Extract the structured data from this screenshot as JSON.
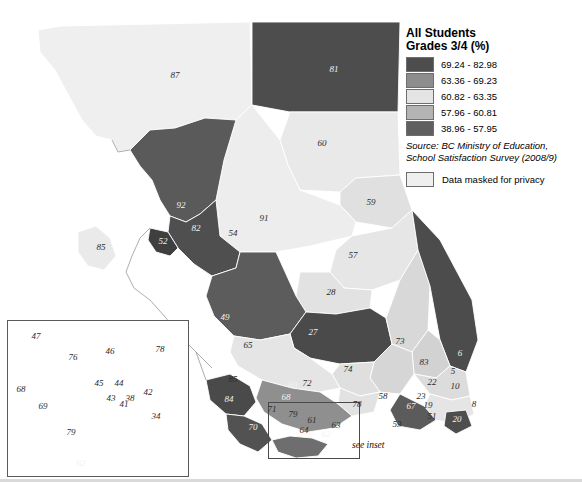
{
  "title": "Students learning about an",
  "legend": {
    "heading_line1": "All Students",
    "heading_line2": "Grades 3/4 (%)",
    "classes": [
      {
        "label": "69.24 - 82.98",
        "color": "#4d4d4d"
      },
      {
        "label": "63.36 - 69.23",
        "color": "#8d8d8d"
      },
      {
        "label": "60.82 - 63.35",
        "color": "#e4e4e4"
      },
      {
        "label": "57.96 - 60.81",
        "color": "#b4b4b4"
      },
      {
        "label": "38.96 - 57.95",
        "color": "#5f5f5f"
      }
    ],
    "source": "Source: BC Ministry of Education, School Satisfaction Survey (2008/9)",
    "masked_label": "Data masked for privacy",
    "masked_color": "#efefef"
  },
  "inset_caption": "see inset",
  "districts": [
    {
      "id": "87",
      "x": 175,
      "y": 75,
      "tone": "light"
    },
    {
      "id": "81",
      "x": 334,
      "y": 69,
      "tone": "dark"
    },
    {
      "id": "60",
      "x": 322,
      "y": 143,
      "tone": "light"
    },
    {
      "id": "59",
      "x": 371,
      "y": 202,
      "tone": "light"
    },
    {
      "id": "92",
      "x": 181,
      "y": 205,
      "tone": "dark"
    },
    {
      "id": "82",
      "x": 196,
      "y": 228,
      "tone": "dark"
    },
    {
      "id": "52",
      "x": 163,
      "y": 241,
      "tone": "dark"
    },
    {
      "id": "85",
      "x": 101,
      "y": 247,
      "tone": "light"
    },
    {
      "id": "91",
      "x": 264,
      "y": 218,
      "tone": "light"
    },
    {
      "id": "54",
      "x": 233,
      "y": 233,
      "tone": "light"
    },
    {
      "id": "57",
      "x": 353,
      "y": 255,
      "tone": "light"
    },
    {
      "id": "28",
      "x": 331,
      "y": 292,
      "tone": "light"
    },
    {
      "id": "49",
      "x": 225,
      "y": 317,
      "tone": "dark"
    },
    {
      "id": "27",
      "x": 313,
      "y": 332,
      "tone": "dark"
    },
    {
      "id": "73",
      "x": 400,
      "y": 341,
      "tone": "light"
    },
    {
      "id": "6",
      "x": 460,
      "y": 353,
      "tone": "dark"
    },
    {
      "id": "83",
      "x": 424,
      "y": 362,
      "tone": "light"
    },
    {
      "id": "5",
      "x": 453,
      "y": 371,
      "tone": "light"
    },
    {
      "id": "22",
      "x": 432,
      "y": 382,
      "tone": "light"
    },
    {
      "id": "10",
      "x": 455,
      "y": 386,
      "tone": "light"
    },
    {
      "id": "23",
      "x": 421,
      "y": 396,
      "tone": "light"
    },
    {
      "id": "67",
      "x": 411,
      "y": 406,
      "tone": "dark"
    },
    {
      "id": "19",
      "x": 428,
      "y": 405,
      "tone": "light"
    },
    {
      "id": "51",
      "x": 432,
      "y": 416,
      "tone": "light"
    },
    {
      "id": "20",
      "x": 457,
      "y": 419,
      "tone": "dark"
    },
    {
      "id": "8",
      "x": 474,
      "y": 404,
      "tone": "light"
    },
    {
      "id": "53",
      "x": 397,
      "y": 424,
      "tone": "light"
    },
    {
      "id": "58",
      "x": 383,
      "y": 396,
      "tone": "light"
    },
    {
      "id": "78",
      "x": 357,
      "y": 404,
      "tone": "light"
    },
    {
      "id": "74",
      "x": 348,
      "y": 369,
      "tone": "light"
    },
    {
      "id": "65",
      "x": 248,
      "y": 345,
      "tone": "light"
    },
    {
      "id": "85b",
      "x": 233,
      "y": 379,
      "tone": "light"
    },
    {
      "id": "84",
      "x": 229,
      "y": 399,
      "tone": "dark"
    },
    {
      "id": "70",
      "x": 253,
      "y": 427,
      "tone": "dark"
    },
    {
      "id": "69",
      "x": 293,
      "y": 385,
      "tone": "dark"
    },
    {
      "id": "72",
      "x": 307,
      "y": 383,
      "tone": "light"
    },
    {
      "id": "68",
      "x": 286,
      "y": 397,
      "tone": "dark"
    },
    {
      "id": "71",
      "x": 272,
      "y": 409,
      "tone": "light"
    },
    {
      "id": "79",
      "x": 293,
      "y": 414,
      "tone": "light"
    },
    {
      "id": "61",
      "x": 312,
      "y": 420,
      "tone": "light"
    },
    {
      "id": "63",
      "x": 336,
      "y": 425,
      "tone": "light"
    },
    {
      "id": "62",
      "x": 326,
      "y": 434,
      "tone": "dark"
    },
    {
      "id": "64",
      "x": 304,
      "y": 430,
      "tone": "light"
    },
    {
      "id": "47",
      "x": 36,
      "y": 336,
      "tone": "light"
    },
    {
      "id": "46",
      "x": 110,
      "y": 351,
      "tone": "light"
    },
    {
      "id": "78i",
      "x": 160,
      "y": 349,
      "tone": "light"
    },
    {
      "id": "76",
      "x": 73,
      "y": 357,
      "tone": "light"
    },
    {
      "id": "45",
      "x": 99,
      "y": 383,
      "tone": "light"
    },
    {
      "id": "44",
      "x": 119,
      "y": 383,
      "tone": "light"
    },
    {
      "id": "42",
      "x": 148,
      "y": 392,
      "tone": "light"
    },
    {
      "id": "43",
      "x": 111,
      "y": 398,
      "tone": "light"
    },
    {
      "id": "38",
      "x": 130,
      "y": 398,
      "tone": "light"
    },
    {
      "id": "41",
      "x": 124,
      "y": 404,
      "tone": "light"
    },
    {
      "id": "34",
      "x": 156,
      "y": 416,
      "tone": "light"
    },
    {
      "id": "68i",
      "x": 21,
      "y": 389,
      "tone": "light"
    },
    {
      "id": "69i",
      "x": 43,
      "y": 406,
      "tone": "light"
    },
    {
      "id": "79i",
      "x": 71,
      "y": 432,
      "tone": "light"
    },
    {
      "id": "62i",
      "x": 81,
      "y": 463,
      "tone": "dark"
    }
  ]
}
